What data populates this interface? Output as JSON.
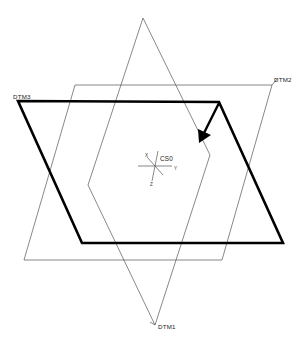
{
  "drawing": {
    "title": "Datum Planes Reference Geometry",
    "background_color": "#ffffff",
    "width": 304,
    "height": 348
  },
  "planes": [
    {
      "id": "dtm1",
      "label": "DTM1",
      "style": "thin",
      "color": "#555555",
      "label_position": "bottom",
      "label_x": 158,
      "label_y": 329,
      "points": "143,18 210,155 155,325 88,185",
      "leader": "150,322 155,325"
    },
    {
      "id": "dtm2",
      "label": "DTM2",
      "style": "thin",
      "color": "#555555",
      "label_position": "top-right",
      "label_x": 274,
      "label_y": 82,
      "points": "75,85 272,85 222,260 24,260",
      "leader": "272,85 278,78"
    },
    {
      "id": "dtm3",
      "label": "DTM3",
      "style": "thick",
      "color": "#000000",
      "label_position": "top-left",
      "label_x": 13,
      "label_y": 99,
      "points": "18,101 219,102 283,243 82,243",
      "leader": "18,101 18,101"
    }
  ],
  "coordinate_system": {
    "name": "CS0",
    "origin_x": 155,
    "origin_y": 166,
    "label_x": 160,
    "label_y": 161,
    "axes": [
      {
        "name": "x",
        "label": "X",
        "label_x": 146,
        "label_y": 158,
        "x1": 155,
        "y1": 166,
        "x2": 147,
        "y2": 157
      },
      {
        "name": "y",
        "label": "Y",
        "label_x": 175,
        "label_y": 170,
        "x1": 155,
        "y1": 166,
        "x2": 172,
        "y2": 166
      },
      {
        "name": "z",
        "label": "Z",
        "label_x": 152,
        "label_y": 184,
        "x1": 155,
        "y1": 166,
        "x2": 152,
        "y2": 181
      },
      {
        "name": "x-neg",
        "label": "",
        "label_x": 0,
        "label_y": 0,
        "x1": 155,
        "y1": 166,
        "x2": 163,
        "y2": 175
      },
      {
        "name": "y-neg",
        "label": "",
        "label_x": 0,
        "label_y": 0,
        "x1": 155,
        "y1": 166,
        "x2": 138,
        "y2": 166
      },
      {
        "name": "z-pos",
        "label": "",
        "label_x": 0,
        "label_y": 0,
        "x1": 155,
        "y1": 166,
        "x2": 158,
        "y2": 151
      }
    ]
  },
  "annotation_arrow": {
    "name": "normal-direction-arrow",
    "shaft_x1": 219,
    "shaft_y1": 103,
    "shaft_x2": 204,
    "shaft_y2": 133,
    "head_points": "199,143 198,129 211,135",
    "color": "#000000"
  }
}
